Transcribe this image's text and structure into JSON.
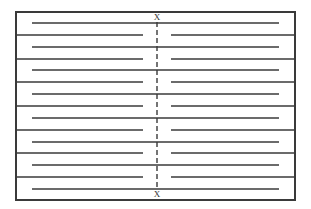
{
  "diagram": {
    "type": "serpentine-baffle-schematic",
    "colors": {
      "background": "#ffffff",
      "stroke": "#3a3a3a",
      "dashed": "#3a3a3a",
      "label": "#333333"
    },
    "frame": {
      "x": 16,
      "y": 12,
      "width": 279,
      "height": 188
    },
    "section_line": {
      "x": 157,
      "y_start": 22,
      "y_end": 189,
      "top_label": "X",
      "bottom_label": "X",
      "top_label_y": 20,
      "bottom_label_y": 197
    },
    "inner_rows": {
      "description": "continuous lines spanning across section line, inset from both borders",
      "x_start": 32,
      "x_end": 279,
      "y": [
        23,
        47,
        70,
        94,
        118,
        142,
        165,
        189
      ]
    },
    "divider_rows": {
      "description": "lines attached to both borders, split around the section line",
      "left_segment": {
        "x_start": 16,
        "x_end": 143
      },
      "right_segment": {
        "x_start": 171,
        "x_end": 295
      },
      "y": [
        35,
        59,
        82,
        106,
        130,
        153,
        177
      ]
    }
  }
}
